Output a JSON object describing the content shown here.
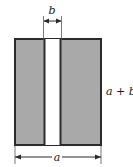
{
  "figure": {
    "type": "geometry-diagram",
    "background_color": "#ffffff",
    "shape": {
      "name": "outer-rectangle",
      "fill_color": "#a9a9a9",
      "stroke_color": "#2b2b2b",
      "stroke_width": 2,
      "x": 14,
      "y": 38,
      "width": 88,
      "height": 108
    },
    "gap": {
      "name": "white-strip",
      "fill_color": "#ffffff",
      "stroke_color": "#2b2b2b",
      "stroke_width": 2,
      "x": 44,
      "y": 38,
      "width": 17,
      "height": 108
    },
    "labels": {
      "top": "b",
      "right": "a + b",
      "bottom": "a"
    },
    "dimensions": [
      {
        "name": "top-dimension-b",
        "label": "b",
        "orientation": "horizontal",
        "from_x": 44,
        "to_x": 61,
        "line_y": 21,
        "extension_from_y": 16,
        "extension_to_y": 40,
        "label_x": 52,
        "label_y": 14
      },
      {
        "name": "bottom-dimension-a",
        "label": "a",
        "orientation": "horizontal",
        "from_x": 15,
        "to_x": 101,
        "line_y": 157,
        "extension_from_y": 146,
        "extension_to_y": 163,
        "label_x": 57,
        "label_y": 161
      },
      {
        "name": "right-label-a-plus-b",
        "label": "a + b",
        "orientation": "vertical-side-label",
        "label_x": 106,
        "label_y": 95
      }
    ],
    "line_color": "#2b2b2b"
  }
}
